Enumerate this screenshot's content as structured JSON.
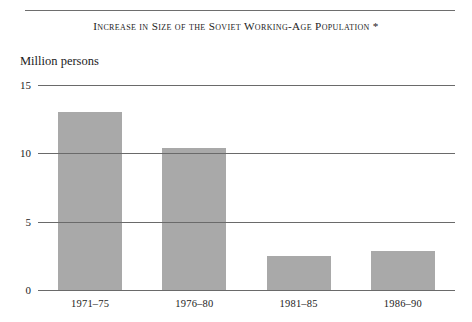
{
  "figure": {
    "title": "Increase in Size of the Soviet Working-Age Population *",
    "y_axis_unit_label": "Million persons"
  },
  "chart_data": {
    "type": "bar",
    "title": "Increase in Size of the Soviet Working-Age Population *",
    "subtitle": "",
    "xlabel": "",
    "ylabel": "Million persons",
    "categories": [
      "1971–75",
      "1976–80",
      "1981–85",
      "1986–90"
    ],
    "values": [
      13.0,
      10.4,
      2.5,
      2.85
    ],
    "ylim": [
      0,
      15
    ],
    "yticks": [
      0,
      5,
      10,
      15
    ],
    "ytick_labels": [
      "0",
      "5",
      "10",
      "15"
    ],
    "grid": true,
    "legend": null,
    "bar_color": "#a9a9a9",
    "axis_color": "#6a6a6a",
    "annotations": [
      "*"
    ]
  }
}
